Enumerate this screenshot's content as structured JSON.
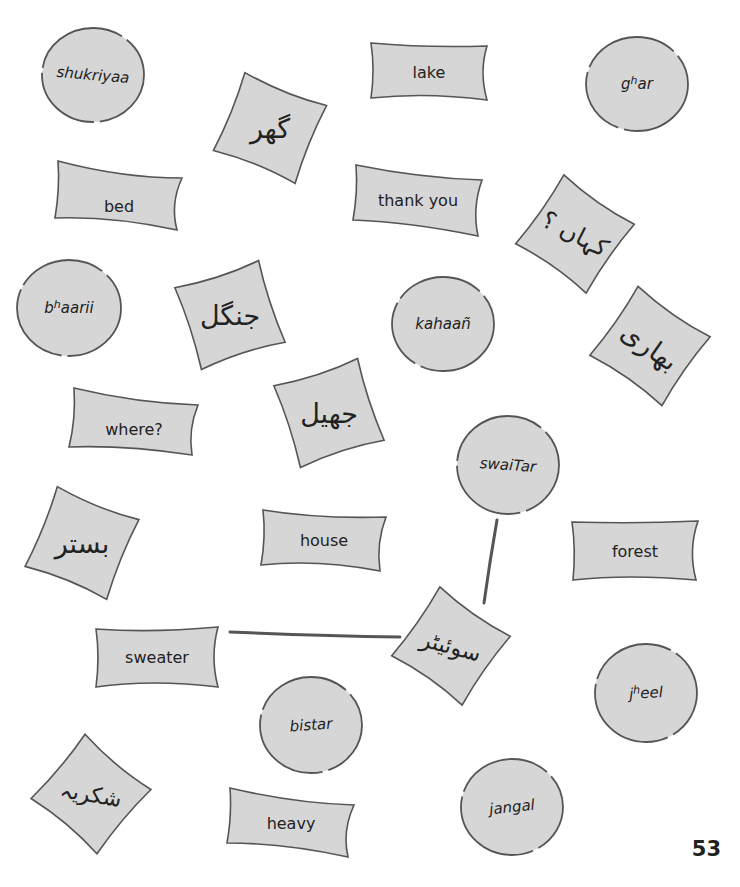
{
  "page": {
    "number": "53",
    "colors": {
      "card_fill": "#d6d6d6",
      "card_stroke": "#555555",
      "text": "#222222",
      "connector": "#555555"
    }
  },
  "english_cards": [
    {
      "id": "lake",
      "text": "lake"
    },
    {
      "id": "bed",
      "text": "bed"
    },
    {
      "id": "thank-you",
      "text": "thank you"
    },
    {
      "id": "where",
      "text": "where?"
    },
    {
      "id": "house",
      "text": "house"
    },
    {
      "id": "forest",
      "text": "forest"
    },
    {
      "id": "sweater",
      "text": "sweater"
    },
    {
      "id": "heavy",
      "text": "heavy"
    }
  ],
  "transliteration_circles": [
    {
      "id": "shukriyaa",
      "text": "shukriyaa"
    },
    {
      "id": "ghar",
      "base": "g",
      "sup": "h",
      "rest": "ar"
    },
    {
      "id": "bhaarii",
      "base": "b",
      "sup": "h",
      "rest": "aarii"
    },
    {
      "id": "kahaan",
      "text": "kahaañ"
    },
    {
      "id": "swaiTar",
      "text": "swaiTar"
    },
    {
      "id": "jheel",
      "base": "j",
      "sup": "h",
      "rest": "eel"
    },
    {
      "id": "bistar",
      "text": "bistar"
    },
    {
      "id": "jangal",
      "text": "jangal"
    }
  ],
  "urdu_squares": [
    {
      "id": "ghar-urdu",
      "text": "گھر"
    },
    {
      "id": "kahaan-urdu",
      "text": "کہاں ؟"
    },
    {
      "id": "jangal-urdu",
      "text": "جنگل"
    },
    {
      "id": "bhaarii-urdu",
      "text": "بھاری"
    },
    {
      "id": "jheel-urdu",
      "text": "جھیل"
    },
    {
      "id": "bistar-urdu",
      "text": "بستر"
    },
    {
      "id": "swaiTar-urdu",
      "text": "سوئیٹر"
    },
    {
      "id": "shukriyaa-urdu",
      "text": "شکریہ"
    }
  ],
  "example_matches": [
    {
      "from": "swaiTar",
      "to": "swaiTar-urdu"
    },
    {
      "from": "swaiTar-urdu",
      "to": "sweater"
    }
  ]
}
